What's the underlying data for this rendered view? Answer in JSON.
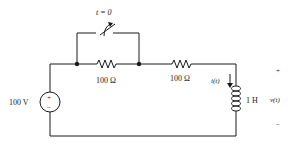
{
  "circuit": {
    "switch": {
      "label": "t = 0"
    },
    "resistor1": {
      "label": "100 Ω"
    },
    "resistor2": {
      "label": "100 Ω"
    },
    "source": {
      "label": "100 V",
      "plus": "+",
      "minus": "−"
    },
    "inductor": {
      "label": "1 H"
    },
    "current": {
      "label": "i(t)"
    },
    "voltage": {
      "label": "v(t)",
      "plus": "+",
      "minus": "−"
    }
  },
  "colors": {
    "wire": "#1a1a1a",
    "background": "#ffffff"
  }
}
